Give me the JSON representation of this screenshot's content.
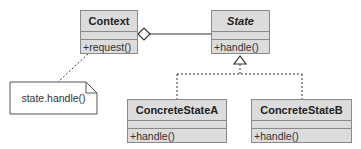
{
  "diagram": {
    "type": "UML class diagram - State pattern",
    "classes": [
      {
        "name": "Context",
        "italic": false,
        "operations": [
          "+request()"
        ]
      },
      {
        "name": "State",
        "italic": true,
        "operations": [
          "+handle()"
        ]
      },
      {
        "name": "ConcreteStateA",
        "italic": false,
        "operations": [
          "+handle()"
        ]
      },
      {
        "name": "ConcreteStateB",
        "italic": false,
        "operations": [
          "+handle()"
        ]
      }
    ],
    "note": {
      "text": "state.handle()"
    },
    "relationships": [
      {
        "from": "Context",
        "to": "State",
        "kind": "aggregation"
      },
      {
        "from": "ConcreteStateA",
        "to": "State",
        "kind": "realization"
      },
      {
        "from": "ConcreteStateB",
        "to": "State",
        "kind": "realization"
      },
      {
        "from": "note",
        "to": "Context",
        "kind": "note-link"
      }
    ],
    "colors": {
      "box_fill": "#dcdcdc",
      "box_border": "#8a8a8a",
      "line": "#333333"
    }
  }
}
